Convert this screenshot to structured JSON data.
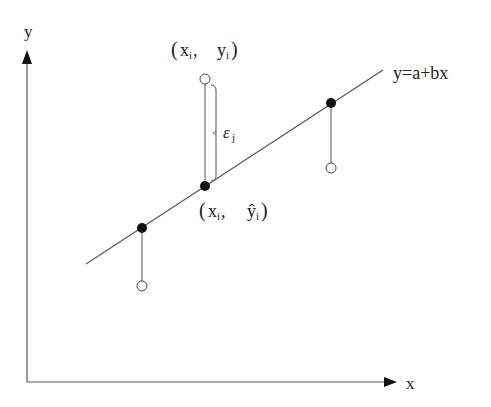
{
  "diagram": {
    "axes": {
      "x_label": "x",
      "y_label": "y"
    },
    "regression_line": {
      "label": "y=a+bx",
      "from": [
        86,
        264
      ],
      "to": [
        383,
        70
      ]
    },
    "points": [
      {
        "fitted": [
          142,
          228
        ],
        "observed": [
          142,
          286
        ]
      },
      {
        "fitted": [
          205,
          186
        ],
        "observed": [
          205,
          79
        ]
      },
      {
        "fitted": [
          331,
          103
        ],
        "observed": [
          331,
          168
        ]
      }
    ],
    "annotations": {
      "observed_label_open": "(",
      "observed_label_x": "x",
      "observed_label_x_sub": "i",
      "observed_label_sep": ",",
      "observed_label_y": "y",
      "observed_label_y_sub": "i",
      "observed_label_close": ")",
      "fitted_label_open": "(",
      "fitted_label_x": "x",
      "fitted_label_x_sub": "i",
      "fitted_label_sep": ",",
      "fitted_label_y": "ŷ",
      "fitted_label_y_sub": "i",
      "fitted_label_close": ")",
      "residual_symbol": "ε",
      "residual_sub": "j"
    },
    "colors": {
      "line": "#555555",
      "dot_fill": "#111111",
      "open_circle_stroke": "#444444",
      "text": "#222222"
    }
  }
}
